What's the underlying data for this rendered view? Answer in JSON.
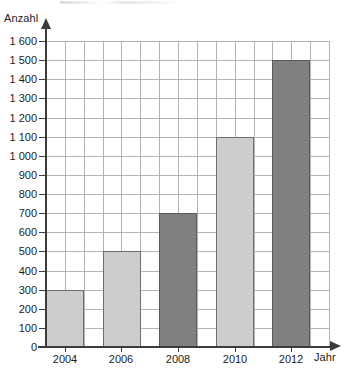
{
  "chart_data": {
    "type": "bar",
    "title": "",
    "subtitle": "",
    "xlabel": "Jahr",
    "ylabel": "Anzahl",
    "categories": [
      "2004",
      "2006",
      "2008",
      "2010",
      "2012"
    ],
    "values": [
      300,
      500,
      700,
      1100,
      1500
    ],
    "series": [
      {
        "name": "Anzahl",
        "values": [
          300,
          500,
          700,
          1100,
          1500
        ]
      }
    ],
    "bar_colors": [
      "#cdcdcd",
      "#cdcdcd",
      "#808080",
      "#cdcdcd",
      "#808080"
    ],
    "bar_styles": [
      "light",
      "light",
      "dark",
      "light",
      "dark"
    ],
    "ylim": [
      0,
      1600
    ],
    "ytick_step": 100,
    "ytick_labels": [
      "1 600",
      "1 500",
      "1 400",
      "1 300",
      "1 200",
      "1 100",
      "1 000",
      "900",
      "800",
      "700",
      "600",
      "500",
      "400",
      "300",
      "200",
      "100",
      "0"
    ],
    "ytick_values": [
      1600,
      1500,
      1400,
      1300,
      1200,
      1100,
      1000,
      900,
      800,
      700,
      600,
      500,
      400,
      300,
      200,
      100,
      0
    ],
    "xtick_labels": [
      "2004",
      "2006",
      "2008",
      "2010",
      "2012"
    ],
    "grid": true,
    "grid_color": "#b4b4b4",
    "axis_color": "#3c3c3c",
    "legend": "none",
    "legend_position": "none",
    "background": "#ffffff"
  },
  "axes": {
    "y_title": "Anzahl",
    "x_title": "Jahr"
  }
}
